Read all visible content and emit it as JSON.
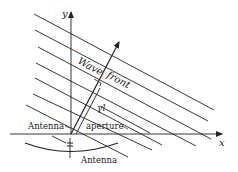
{
  "figure": {
    "axes": {
      "x_label": "x",
      "y_label": "y"
    },
    "labels": {
      "wave": "Wave",
      "front": "front",
      "gamma_l": "γl",
      "antenna_left": "Antenna",
      "aperture": "aperture",
      "antenna_bottom": "Antenna"
    },
    "wavefront_count": 9,
    "colors": {
      "ink": "#222222",
      "background": "#ffffff"
    }
  }
}
